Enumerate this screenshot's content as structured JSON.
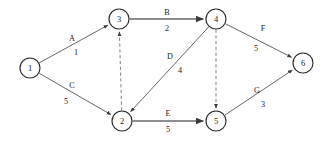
{
  "diagram": {
    "type": "directed-graph",
    "title": "",
    "background_color": "#ffffff",
    "node_stroke_color": "#2a2a2a",
    "thin_edge_color": "#4a4a4a",
    "thick_edge_color": "#8e8e8e",
    "dashed_edge_color": "#6a6a6a",
    "text_color": "#1a1a1a",
    "nodes": [
      {
        "id": "1",
        "label": "1",
        "cx": 30,
        "cy": 68,
        "r": 10
      },
      {
        "id": "3",
        "label": "3",
        "cx": 119,
        "cy": 19,
        "r": 10
      },
      {
        "id": "4",
        "label": "4",
        "cx": 216,
        "cy": 19,
        "r": 10
      },
      {
        "id": "6",
        "label": "6",
        "cx": 303,
        "cy": 63,
        "r": 10
      },
      {
        "id": "2",
        "label": "2",
        "cx": 122,
        "cy": 121,
        "r": 10
      },
      {
        "id": "5",
        "label": "5",
        "cx": 216,
        "cy": 121,
        "r": 10
      }
    ],
    "edges": [
      {
        "name": "A",
        "weight": "1",
        "from": "1",
        "to": "3",
        "style": "solid-thin",
        "arrow": true,
        "label_x": 72,
        "label_y": 38,
        "weight_x": 76,
        "weight_y": 52
      },
      {
        "name": "B",
        "weight": "2",
        "from": "3",
        "to": "4",
        "style": "solid-thick",
        "arrow": true,
        "label_x": 167,
        "label_y": 12,
        "weight_x": 167,
        "weight_y": 28
      },
      {
        "name": "C",
        "weight": "5",
        "from": "1",
        "to": "2",
        "style": "solid-thin",
        "arrow": true,
        "label_x": 72,
        "label_y": 85,
        "weight_x": 66,
        "weight_y": 101
      },
      {
        "name": "D",
        "weight": "4",
        "from": "4",
        "to": "2",
        "style": "solid-thin",
        "arrow": true,
        "label_x": 170,
        "label_y": 56,
        "weight_x": 180,
        "weight_y": 70
      },
      {
        "name": "E",
        "weight": "5",
        "from": "2",
        "to": "5",
        "style": "solid-thick",
        "arrow": true,
        "label_x": 168,
        "label_y": 113,
        "weight_x": 168,
        "weight_y": 129
      },
      {
        "name": "F",
        "weight": "5",
        "from": "4",
        "to": "6",
        "style": "solid-thin",
        "arrow": true,
        "label_x": 263,
        "label_y": 28,
        "weight_x": 256,
        "weight_y": 48
      },
      {
        "name": "G",
        "weight": "3",
        "from": "5",
        "to": "6",
        "style": "solid-thin",
        "arrow": true,
        "label_x": 257,
        "label_y": 90,
        "weight_x": 263,
        "weight_y": 104
      },
      {
        "name": "",
        "weight": "",
        "from": "2",
        "to": "3",
        "style": "dashed",
        "arrow": true,
        "label_x": 0,
        "label_y": 0,
        "weight_x": 0,
        "weight_y": 0
      },
      {
        "name": "",
        "weight": "",
        "from": "4",
        "to": "5",
        "style": "dashed",
        "arrow": true,
        "label_x": 0,
        "label_y": 0,
        "weight_x": 0,
        "weight_y": 0
      }
    ]
  }
}
